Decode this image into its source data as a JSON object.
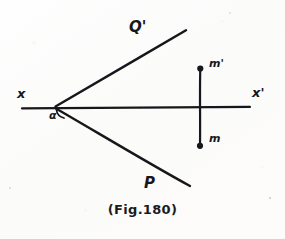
{
  "figure": {
    "caption": "(Fig.180)",
    "ink_color": "#17171a",
    "paper_color": "#fdfdfc",
    "width": 285,
    "height": 239,
    "labels": {
      "upper_ray": "Q'",
      "lower_ray": "P",
      "axis_left": "x",
      "axis_right": "x'",
      "point_top": "m'",
      "point_bottom": "m",
      "angle": "α"
    },
    "geometry": {
      "vertex": {
        "x": 55,
        "y": 107
      },
      "axis": {
        "x1": 22,
        "y1": 108,
        "x2": 250,
        "y2": 107
      },
      "upper_ray": {
        "x1": 55,
        "y1": 106,
        "x2": 186,
        "y2": 30
      },
      "lower_ray": {
        "x1": 55,
        "y1": 108,
        "x2": 190,
        "y2": 186
      },
      "vertical_segment": {
        "x": 200,
        "y_top": 68,
        "y_bottom": 146
      },
      "dot_top": {
        "x": 200,
        "y": 68,
        "r": 3
      },
      "dot_bottom": {
        "x": 200,
        "y": 146,
        "r": 3
      },
      "angle_arc": {
        "cx": 55,
        "cy": 107,
        "r": 13
      }
    }
  }
}
